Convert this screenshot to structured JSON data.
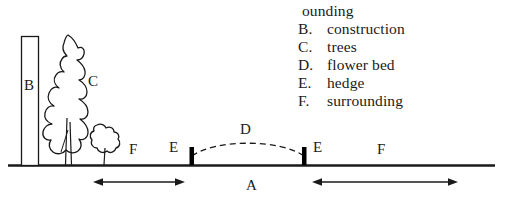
{
  "figure": {
    "type": "line-drawing-diagram"
  },
  "legend": {
    "truncated_first_line": "ounding",
    "items": [
      {
        "key": "B.",
        "label": "construction"
      },
      {
        "key": "C.",
        "label": "trees"
      },
      {
        "key": "D.",
        "label": "flower bed"
      },
      {
        "key": "E.",
        "label": "hedge"
      },
      {
        "key": "F.",
        "label": "surrounding"
      }
    ]
  },
  "diagram": {
    "labels": {
      "building": "B",
      "trees": "C",
      "flower_bed": "D",
      "hedge_left": "E",
      "hedge_right": "E",
      "surrounding_left": "F",
      "surrounding_right": "F",
      "area": "A"
    },
    "colors": {
      "ink": "#1a1a1a",
      "background": "#ffffff",
      "hedge_fill": "#000000"
    }
  }
}
